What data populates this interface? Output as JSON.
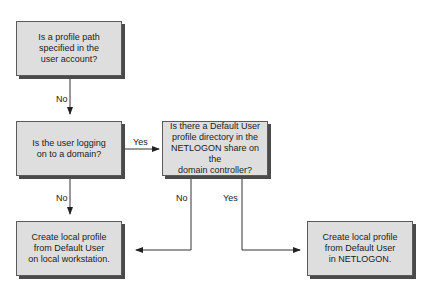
{
  "diagram": {
    "nodes": [
      {
        "id": "profile-path",
        "text": "Is a profile path\nspecified in the\nuser account?"
      },
      {
        "id": "logging-domain",
        "text": "Is the user logging\non to a domain?"
      },
      {
        "id": "default-user-netlogon",
        "text": "Is there a Default User\nprofile directory in the\nNETLOGON share on the\ndomain controller?"
      },
      {
        "id": "create-local-workstation",
        "text": "Create local profile\nfrom Default User\non local workstation."
      },
      {
        "id": "create-netlogon",
        "text": "Create local profile\nfrom Default User\nin NETLOGON."
      }
    ],
    "edges": [
      {
        "from": "profile-path",
        "to": "logging-domain",
        "label": "No"
      },
      {
        "from": "logging-domain",
        "to": "default-user-netlogon",
        "label": "Yes"
      },
      {
        "from": "logging-domain",
        "to": "create-local-workstation",
        "label": "No"
      },
      {
        "from": "default-user-netlogon",
        "to": "create-local-workstation",
        "label": "No"
      },
      {
        "from": "default-user-netlogon",
        "to": "create-netlogon",
        "label": "Yes"
      }
    ],
    "colors": {
      "box_fill": "#dedede",
      "box_border": "#5a5a5a",
      "shadow": "#4a4a4a",
      "line": "#333333"
    }
  }
}
